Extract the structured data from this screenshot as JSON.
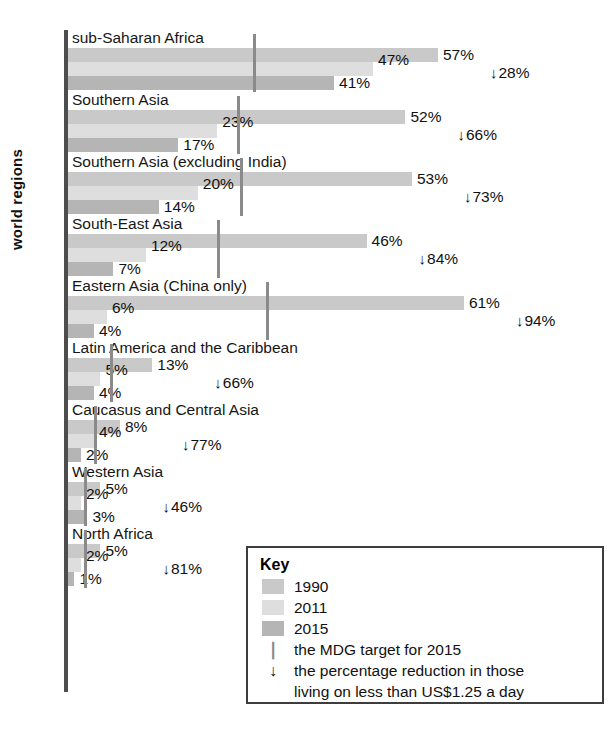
{
  "chart_data": {
    "type": "bar",
    "orientation": "horizontal",
    "title": "",
    "xlabel": "",
    "ylabel": "world regions",
    "xlim": [
      0,
      70
    ],
    "grid": false,
    "legend_position": "inside-bottom-right",
    "categories": [
      "sub-Saharan Africa",
      "Southern Asia",
      "Southern Asia (excluding India)",
      "South-East Asia",
      "Eastern Asia (China only)",
      "Latin America and the Caribbean",
      "Caucasus and Central Asia",
      "Western Asia",
      "North Africa"
    ],
    "series": [
      {
        "name": "1990",
        "color": "#c9c9c9",
        "values": [
          57,
          52,
          53,
          46,
          61,
          13,
          8,
          5,
          5
        ]
      },
      {
        "name": "2011",
        "color": "#dedede",
        "values": [
          47,
          23,
          20,
          12,
          6,
          5,
          4,
          2,
          2
        ]
      },
      {
        "name": "2015",
        "color": "#b5b5b5",
        "values": [
          41,
          17,
          14,
          7,
          4,
          4,
          2,
          3,
          1
        ]
      }
    ],
    "value_labels": [
      {
        "y1990": "57%",
        "y2011": "47%",
        "y2015": "41%"
      },
      {
        "y1990": "52%",
        "y2011": "23%",
        "y2015": "17%"
      },
      {
        "y1990": "53%",
        "y2011": "20%",
        "y2015": "14%"
      },
      {
        "y1990": "46%",
        "y2011": "12%",
        "y2015": "7%"
      },
      {
        "y1990": "61%",
        "y2011": "6%",
        "y2015": "4%"
      },
      {
        "y1990": "13%",
        "y2011": "5%",
        "y2015": "4%"
      },
      {
        "y1990": "8%",
        "y2011": "4%",
        "y2015": "2%"
      },
      {
        "y1990": "5%",
        "y2011": "2%",
        "y2015": "3%"
      },
      {
        "y1990": "5%",
        "y2011": "2%",
        "y2015": "1%"
      }
    ],
    "mdg_target_2015": [
      28.5,
      26,
      26.5,
      23,
      30.5,
      6.5,
      4,
      2.5,
      2.5
    ],
    "reduction_labels": [
      "28%",
      "66%",
      "73%",
      "84%",
      "94%",
      "66%",
      "77%",
      "46%",
      "81%"
    ],
    "reduction_values": [
      28,
      66,
      73,
      84,
      94,
      66,
      77,
      46,
      81
    ],
    "annotations": {
      "arrow_glyph": "↓",
      "tick_glyph": "❘"
    }
  },
  "key": {
    "title": "Key",
    "rows": [
      {
        "kind": "swatch",
        "series": "1990",
        "label": "1990"
      },
      {
        "kind": "swatch",
        "series": "2011",
        "label": "2011"
      },
      {
        "kind": "swatch",
        "series": "2015",
        "label": "2015"
      },
      {
        "kind": "tick",
        "label": "the MDG target for 2015"
      },
      {
        "kind": "arrow",
        "label": "the percentage reduction in those",
        "label2": "living on less than US$1.25 a day"
      }
    ]
  }
}
